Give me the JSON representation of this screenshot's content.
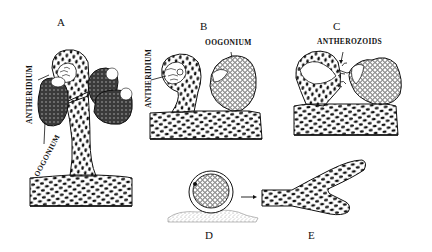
{
  "figure": {
    "panels": [
      {
        "id": "A",
        "label": "A",
        "annotations": [
          "ANTHERIDIUM",
          "OOGONIUM"
        ]
      },
      {
        "id": "B",
        "label": "B",
        "annotations": [
          "ANTHERIDIUM",
          "OOGONIUM"
        ]
      },
      {
        "id": "C",
        "label": "C",
        "annotations": [
          "ANTHERIDIUM",
          "ANTHEROZOIDS"
        ]
      },
      {
        "id": "D",
        "label": "D",
        "annotations": []
      },
      {
        "id": "E",
        "label": "E",
        "annotations": []
      }
    ]
  },
  "labels": {
    "panel_a": "A",
    "panel_b": "B",
    "panel_c": "C",
    "panel_d": "D",
    "panel_e": "E",
    "a_antheridium": "ANTHERIDIUM",
    "a_oogonium": "OOGONIUM",
    "b_antheridium": "ANTHERIDIUM",
    "b_oogonium": "OOGONIUM",
    "c_antherozoids": "ANTHEROZOIDS"
  },
  "colors": {
    "ink": "#111111",
    "background": "#ffffff",
    "dark_fill": "#3a3a3a",
    "speckle": "#9a9a9a"
  }
}
